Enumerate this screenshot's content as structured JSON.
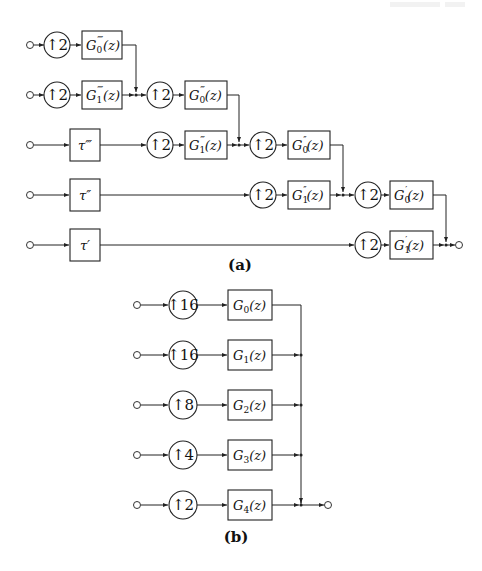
{
  "figure": {
    "parts": [
      {
        "id": "a",
        "caption": "(a)",
        "upsamplers": [
          "↑2",
          "↑2",
          "↑2",
          "↑2",
          "↑2",
          "↑2",
          "↑2",
          "↑2"
        ],
        "delays": [
          "τ‴",
          "τ″",
          "τ′"
        ],
        "filters": {
          "g0_4p": {
            "base": "G",
            "sub": "0",
            "prime": "⁗",
            "arg": "(z)"
          },
          "g1_4p": {
            "base": "G",
            "sub": "1",
            "prime": "⁗",
            "arg": "(z)"
          },
          "g0_3p": {
            "base": "G",
            "sub": "0",
            "prime": "‴",
            "arg": "(z)"
          },
          "g1_3p": {
            "base": "G",
            "sub": "1",
            "prime": "‴",
            "arg": "(z)"
          },
          "g0_2p": {
            "base": "G",
            "sub": "0",
            "prime": "″",
            "arg": "(z)"
          },
          "g1_2p": {
            "base": "G",
            "sub": "1",
            "prime": "″",
            "arg": "(z)"
          },
          "g0_1p": {
            "base": "G",
            "sub": "0",
            "prime": "′",
            "arg": "(z)"
          },
          "g1_1p": {
            "base": "G",
            "sub": "1",
            "prime": "′",
            "arg": "(z)"
          }
        }
      },
      {
        "id": "b",
        "caption": "(b)",
        "rows": [
          {
            "upsampler": "↑16",
            "filter_base": "G",
            "filter_sub": "0",
            "filter_arg": "(z)"
          },
          {
            "upsampler": "↑16",
            "filter_base": "G",
            "filter_sub": "1",
            "filter_arg": "(z)"
          },
          {
            "upsampler": "↑8",
            "filter_base": "G",
            "filter_sub": "2",
            "filter_arg": "(z)"
          },
          {
            "upsampler": "↑4",
            "filter_base": "G",
            "filter_sub": "3",
            "filter_arg": "(z)"
          },
          {
            "upsampler": "↑2",
            "filter_base": "G",
            "filter_sub": "4",
            "filter_arg": "(z)"
          }
        ]
      }
    ],
    "colors": {
      "line": "#222222",
      "background": "#ffffff"
    }
  }
}
